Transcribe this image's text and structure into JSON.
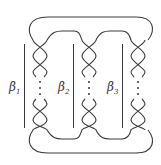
{
  "diagram": {
    "type": "pretzel-link",
    "columns": [
      {
        "label": "β",
        "sub": "1",
        "center_x": 40
      },
      {
        "label": "β",
        "sub": "2",
        "center_x": 89
      },
      {
        "label": "β",
        "sub": "3",
        "center_x": 138
      }
    ],
    "ellipsis": "⋮",
    "stroke_color": "#3a3a3a"
  }
}
